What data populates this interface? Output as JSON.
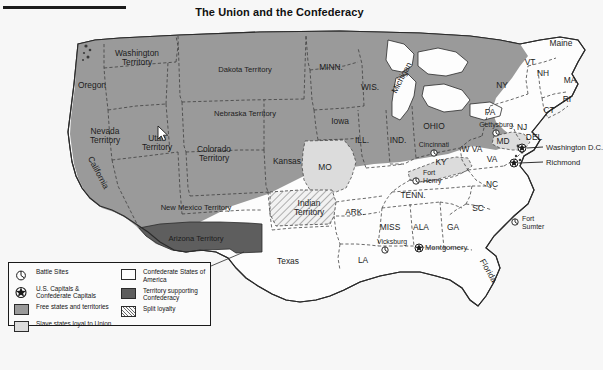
{
  "page": {
    "title": "The Union and the Confederacy",
    "background_color": "#f7f7f7"
  },
  "colors": {
    "free_states": "#9a9a9a",
    "slave_loyal_union": "#dcdcdc",
    "confederate_states": "#fdfdfd",
    "territory_supporting_confederacy": "#5e5e5e",
    "split_loyalty": "#efefef",
    "outline": "#2b2b2b",
    "internal_border": "#3a3a3a",
    "text": "#1c1c1c"
  },
  "cursor": {
    "name": "arrow-cursor",
    "x": 158,
    "y": 126
  },
  "legend": {
    "left_column": [
      {
        "symbol": "battle-site-icon",
        "type": "icon",
        "label": "Battle Sites"
      },
      {
        "symbol": "capital-star-icon",
        "type": "icon",
        "label": "U.S. Capitals & Confederate Capitals"
      },
      {
        "symbol": "swatch",
        "type": "swatch",
        "fill": "#9a9a9a",
        "label": "Free states and territories"
      },
      {
        "symbol": "swatch",
        "type": "swatch",
        "fill": "#dcdcdc",
        "label": "Slave states loyal to Union"
      }
    ],
    "right_column": [
      {
        "symbol": "swatch",
        "type": "swatch",
        "fill": "#fdfdfd",
        "label": "Confederate States of America"
      },
      {
        "symbol": "swatch",
        "type": "swatch",
        "fill": "#5e5e5e",
        "label": "Territory supporting Confederacy"
      },
      {
        "symbol": "swatch",
        "type": "swatch",
        "fill": "hatch",
        "label": "Split loyalty"
      }
    ]
  },
  "map": {
    "regions": [
      {
        "name": "Washington Territory",
        "category": "free",
        "label_x": 137,
        "label_y": 56,
        "lines": [
          "Washington",
          "Territory"
        ]
      },
      {
        "name": "Oregon",
        "category": "free",
        "label_x": 92,
        "label_y": 88,
        "lines": [
          "Oregon"
        ]
      },
      {
        "name": "Dakota Territory",
        "category": "free",
        "label_x": 245,
        "label_y": 72,
        "lines": [
          "Dakota Territory"
        ]
      },
      {
        "name": "MINN.",
        "category": "free",
        "label_x": 331,
        "label_y": 70,
        "lines": [
          "MINN."
        ]
      },
      {
        "name": "WIS.",
        "category": "free",
        "label_x": 370,
        "label_y": 90,
        "lines": [
          "WIS."
        ]
      },
      {
        "name": "Michigan",
        "category": "free",
        "label_x": 404,
        "label_y": 79,
        "lines": [
          "Michigan"
        ],
        "rotate": -62
      },
      {
        "name": "Iowa",
        "category": "free",
        "label_x": 340,
        "label_y": 124,
        "lines": [
          "Iowa"
        ]
      },
      {
        "name": "Nevada Territory",
        "category": "free",
        "label_x": 105,
        "label_y": 134,
        "lines": [
          "Nevada",
          "Territory"
        ]
      },
      {
        "name": "Utah Territory",
        "category": "free",
        "label_x": 157,
        "label_y": 141,
        "lines": [
          "Utah",
          "Territory"
        ]
      },
      {
        "name": "Nebraska Territory",
        "category": "free",
        "label_x": 245,
        "label_y": 116,
        "lines": [
          "Nebraska Territory"
        ]
      },
      {
        "name": "Colorado Territory",
        "category": "free",
        "label_x": 214,
        "label_y": 152,
        "lines": [
          "Colorado",
          "Territory"
        ]
      },
      {
        "name": "Kansas",
        "category": "free",
        "label_x": 287,
        "label_y": 164,
        "lines": [
          "Kansas"
        ]
      },
      {
        "name": "California",
        "category": "free",
        "label_x": 96,
        "label_y": 174,
        "lines": [
          "California"
        ],
        "rotate": 62
      },
      {
        "name": "New Mexico Territory",
        "category": "free",
        "label_x": 196,
        "label_y": 210,
        "lines": [
          "New Mexico Territory"
        ]
      },
      {
        "name": "Arizona Territory",
        "category": "confederate_territory",
        "label_x": 196,
        "label_y": 241,
        "lines": [
          "Arizona Territory"
        ]
      },
      {
        "name": "ILL.",
        "category": "free",
        "label_x": 362,
        "label_y": 143,
        "lines": [
          "ILL."
        ]
      },
      {
        "name": "IND.",
        "category": "free",
        "label_x": 398,
        "label_y": 143,
        "lines": [
          "IND."
        ]
      },
      {
        "name": "OHIO",
        "category": "free",
        "label_x": 434,
        "label_y": 129,
        "lines": [
          "OHIO"
        ]
      },
      {
        "name": "PA",
        "category": "free",
        "label_x": 490,
        "label_y": 115,
        "lines": [
          "PA"
        ]
      },
      {
        "name": "NY",
        "category": "free",
        "label_x": 502,
        "label_y": 88,
        "lines": [
          "NY"
        ]
      },
      {
        "name": "VT",
        "category": "free",
        "label_x": 530,
        "label_y": 65,
        "lines": [
          "VT"
        ]
      },
      {
        "name": "NH",
        "category": "free",
        "label_x": 543,
        "label_y": 76,
        "lines": [
          "NH"
        ]
      },
      {
        "name": "Maine",
        "category": "free",
        "label_x": 561,
        "label_y": 46,
        "lines": [
          "Maine"
        ]
      },
      {
        "name": "MA",
        "category": "free",
        "label_x": 570,
        "label_y": 83,
        "lines": [
          "MA"
        ]
      },
      {
        "name": "RI",
        "category": "free",
        "label_x": 567,
        "label_y": 102,
        "lines": [
          "RI"
        ]
      },
      {
        "name": "CT",
        "category": "free",
        "label_x": 549,
        "label_y": 113,
        "lines": [
          "CT"
        ]
      },
      {
        "name": "NJ",
        "category": "free",
        "label_x": 522,
        "label_y": 130,
        "lines": [
          "NJ"
        ]
      },
      {
        "name": "DEL",
        "category": "slave_union",
        "label_x": 534,
        "label_y": 140,
        "lines": [
          "DEL"
        ]
      },
      {
        "name": "MD",
        "category": "slave_union",
        "label_x": 503,
        "label_y": 144,
        "lines": [
          "MD"
        ]
      },
      {
        "name": "W VA",
        "category": "free",
        "label_x": 472,
        "label_y": 152,
        "lines": [
          "W VA"
        ]
      },
      {
        "name": "MO",
        "category": "slave_union",
        "label_x": 325,
        "label_y": 170,
        "lines": [
          "MO"
        ]
      },
      {
        "name": "KY",
        "category": "slave_union",
        "label_x": 441,
        "label_y": 165,
        "lines": [
          "KY"
        ]
      },
      {
        "name": "VA",
        "category": "confederate",
        "label_x": 492,
        "label_y": 162,
        "lines": [
          "VA"
        ]
      },
      {
        "name": "NC",
        "category": "confederate",
        "label_x": 492,
        "label_y": 187,
        "lines": [
          "NC"
        ]
      },
      {
        "name": "SC",
        "category": "confederate",
        "label_x": 478,
        "label_y": 211,
        "lines": [
          "SC"
        ]
      },
      {
        "name": "TENN.",
        "category": "confederate",
        "label_x": 413,
        "label_y": 198,
        "lines": [
          "TENN."
        ]
      },
      {
        "name": "ARK.",
        "category": "confederate",
        "label_x": 355,
        "label_y": 215,
        "lines": [
          "ARK."
        ]
      },
      {
        "name": "Indian Territory",
        "category": "split",
        "label_x": 309,
        "label_y": 206,
        "lines": [
          "Indian",
          "Territory"
        ]
      },
      {
        "name": "MISS",
        "category": "confederate",
        "label_x": 390,
        "label_y": 230,
        "lines": [
          "MISS"
        ]
      },
      {
        "name": "ALA",
        "category": "confederate",
        "label_x": 421,
        "label_y": 230,
        "lines": [
          "ALA"
        ]
      },
      {
        "name": "GA",
        "category": "confederate",
        "label_x": 453,
        "label_y": 230,
        "lines": [
          "GA"
        ]
      },
      {
        "name": "LA",
        "category": "confederate",
        "label_x": 363,
        "label_y": 263,
        "lines": [
          "LA"
        ]
      },
      {
        "name": "Texas",
        "category": "confederate",
        "label_x": 288,
        "label_y": 264,
        "lines": [
          "Texas"
        ]
      },
      {
        "name": "Florida",
        "category": "confederate",
        "label_x": 486,
        "label_y": 272,
        "lines": [
          "Florida"
        ],
        "rotate": 60
      }
    ],
    "battle_sites": [
      {
        "name": "Gettysburg",
        "label": "Gettysburg",
        "marker_x": 496,
        "marker_y": 133,
        "label_x": 496,
        "label_y": 127,
        "label_anchor": "middle"
      },
      {
        "name": "Cincinnati",
        "label": "Cincinnati",
        "marker_x": 434,
        "marker_y": 153,
        "label_x": 434,
        "label_y": 147,
        "label_anchor": "middle"
      },
      {
        "name": "Fort Henry",
        "label": "Fort Henry",
        "marker_x": 416,
        "marker_y": 181,
        "label_x": 423,
        "label_y": 175,
        "label_anchor": "start",
        "lines": [
          "Fort",
          "Henry"
        ]
      },
      {
        "name": "Fort Sumter",
        "label": "Fort Sumter",
        "marker_x": 515,
        "marker_y": 222,
        "label_x": 522,
        "label_y": 221,
        "label_anchor": "start",
        "lines": [
          "Fort",
          "Sumter"
        ]
      },
      {
        "name": "Vicksburg",
        "label": "Vicksburg",
        "marker_x": 385,
        "marker_y": 250,
        "label_x": 392,
        "label_y": 244,
        "label_anchor": "middle"
      }
    ],
    "capitals": [
      {
        "name": "Washington D.C.",
        "label": "Washington D.C.",
        "marker_x": 522,
        "marker_y": 148,
        "label_x": 546,
        "label_y": 150,
        "leader": true
      },
      {
        "name": "Richmond",
        "label": "Richmond",
        "marker_x": 514,
        "marker_y": 163,
        "label_x": 546,
        "label_y": 165,
        "leader": true
      },
      {
        "name": "Montgomery",
        "label": "Montgomery",
        "marker_x": 419,
        "marker_y": 248,
        "label_x": 425,
        "label_y": 250,
        "leader": false
      }
    ]
  }
}
